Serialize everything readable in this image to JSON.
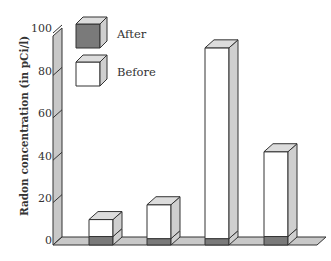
{
  "chart_data": {
    "type": "bar",
    "style": "3d-stacked",
    "title": "",
    "xlabel": "",
    "ylabel": "Radon concentration (in pCi/l)",
    "ylim": [
      0,
      100
    ],
    "yticks": [
      0,
      20,
      40,
      60,
      80,
      100
    ],
    "categories": [
      "1",
      "2",
      "3",
      "4"
    ],
    "series": [
      {
        "name": "After",
        "color": "#7a7a7a",
        "values": [
          4,
          3,
          3,
          4
        ]
      },
      {
        "name": "Before",
        "color": "#ffffff",
        "values": [
          12,
          19,
          93,
          44
        ]
      }
    ],
    "legend": {
      "position": "top-left",
      "entries": [
        "After",
        "Before"
      ]
    },
    "grid": false
  },
  "axis": {
    "ylabel": "Radon concentration (in pCi/l)",
    "ticks": [
      "0",
      "20",
      "40",
      "60",
      "80",
      "100"
    ]
  },
  "legend": {
    "after_label": "After",
    "before_label": "Before"
  },
  "colors": {
    "wall": "#c8c8c8",
    "floor": "#c8c8c8",
    "after": "#7a7a7a",
    "bar_side": "#cfcfcf",
    "bar_top": "#dcdcdc",
    "stroke": "#333333"
  }
}
